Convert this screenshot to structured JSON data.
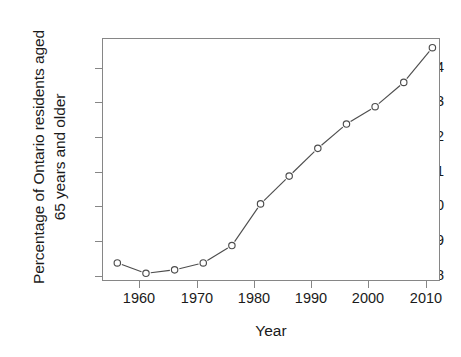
{
  "chart_data": {
    "type": "line",
    "title": "",
    "xlabel": "Year",
    "ylabel": "Percentage of Ontario residents aged 65 years and older",
    "ylabel_lines": [
      "Percentage of Ontario residents aged",
      "65 years and older"
    ],
    "x": [
      1956,
      1961,
      1966,
      1971,
      1976,
      1981,
      1986,
      1991,
      1996,
      2001,
      2006,
      2011
    ],
    "values": [
      8.4,
      8.1,
      8.2,
      8.4,
      8.9,
      10.1,
      10.9,
      11.7,
      12.4,
      12.9,
      13.6,
      14.6
    ],
    "series": [
      {
        "name": "Percentage of Ontario residents aged 65 years and older",
        "values": [
          8.4,
          8.1,
          8.2,
          8.4,
          8.9,
          10.1,
          10.9,
          11.7,
          12.4,
          12.9,
          13.6,
          14.6
        ]
      }
    ],
    "xlim": [
      1953.5,
      2012.5
    ],
    "ylim": [
      7.85,
      14.85
    ],
    "xticks": [
      1960,
      1970,
      1980,
      1990,
      2000,
      2010
    ],
    "xtick_labels": [
      "1960",
      "1970",
      "1980",
      "1990",
      "2000",
      "2010"
    ],
    "yticks": [
      8,
      9,
      10,
      11,
      12,
      13,
      14
    ],
    "ytick_labels": [
      "8",
      "9",
      "10",
      "11",
      "12",
      "13",
      "14"
    ],
    "grid": false,
    "legend": "none",
    "marker": "open-circle",
    "line_style": "solid",
    "line_color": "#4d4d4d",
    "marker_color": "#4d4d4d",
    "frame_color": "#868686",
    "background": "#ffffff"
  }
}
